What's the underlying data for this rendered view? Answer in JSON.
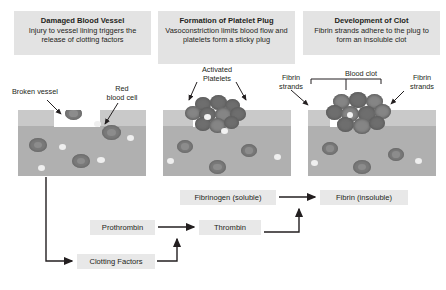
{
  "panels": [
    {
      "title": "Damaged Blood Vessel",
      "body": "Injury to vessel lining triggers\nthe release of clotting factors",
      "labels": [
        {
          "name": "broken-vessel",
          "text": "Broken vessel"
        },
        {
          "name": "red-blood-cell",
          "text": "Red\nblood cell"
        }
      ]
    },
    {
      "title": "Formation of Platelet Plug",
      "body": "Vasoconstriction limits blood\nflow and platelets form a\nsticky plug",
      "labels": [
        {
          "name": "activated-platelets",
          "text": "Activated\nPlatelets"
        }
      ]
    },
    {
      "title": "Development of Clot",
      "body": "Fibrin strands adhere to the\nplug to form an insoluble clot",
      "labels": [
        {
          "name": "fibrin-strands-left",
          "text": "Fibrin\nstrands"
        },
        {
          "name": "blood-clot",
          "text": "Blood clot"
        },
        {
          "name": "fibrin-strands-right",
          "text": "Fibrin\nstrands"
        }
      ]
    }
  ],
  "flow": {
    "fibrinogen": "Fibrinogen (soluble)",
    "fibrin": "Fibrin (insoluble)",
    "prothrombin": "Prothrombin",
    "thrombin": "Thrombin",
    "clotting_factors": "Clotting Factors"
  },
  "colors": {
    "caption_bg": "#e3e3e3",
    "flow_bg": "#e8e8e8",
    "text": "#231f20",
    "vessel_wall": "#c9c9c9",
    "vessel_lumen": "#b0b0b0",
    "cell": "#7a7a7a"
  }
}
